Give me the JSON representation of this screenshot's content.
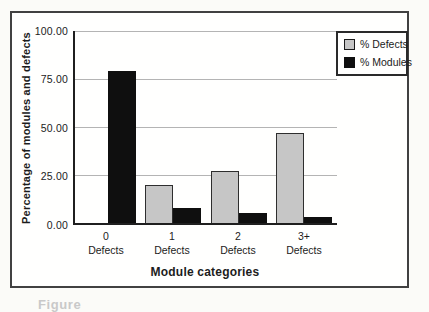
{
  "figure": {
    "caption_fragment": "Figure"
  },
  "chart_data": {
    "type": "bar",
    "title": "",
    "xlabel": "Module categories",
    "ylabel": "Percentage of modules and defects",
    "categories": [
      "0 Defects",
      "1 Defects",
      "2 Defects",
      "3+ Defects"
    ],
    "category_labels_line1": [
      "0",
      "1",
      "2",
      "3+"
    ],
    "category_labels_line2": [
      "Defects",
      "Defects",
      "Defects",
      "Defects"
    ],
    "series": [
      {
        "name": "% Defects",
        "color": "#c6c6c6",
        "values": [
          0,
          20,
          27,
          47
        ]
      },
      {
        "name": "% Modules",
        "color": "#0f0f0f",
        "values": [
          79,
          8,
          5,
          3
        ]
      }
    ],
    "ylim": [
      0,
      100
    ],
    "y_ticks": [
      0,
      25,
      50,
      75,
      100
    ],
    "y_tick_labels": [
      "0.00",
      "25.00",
      "50.00",
      "75.00",
      "100.00"
    ],
    "grid": true,
    "legend_position": "top-right",
    "colors": {
      "axis": "#1f1f1f",
      "gridline": "#b4b4b4",
      "defects_fill": "#c6c6c6",
      "modules_fill": "#0f0f0f"
    }
  }
}
